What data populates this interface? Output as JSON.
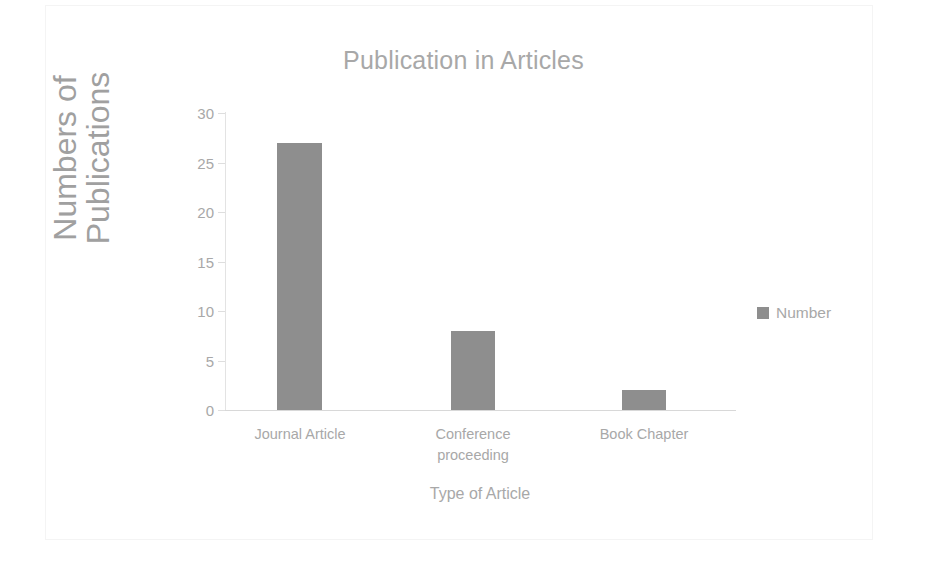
{
  "chart_data": {
    "type": "bar",
    "title": "Publication in Articles",
    "xlabel": "Type of Article",
    "ylabel": "Numbers of Publications",
    "ylabel_lines": [
      "Numbers of",
      "Publications"
    ],
    "categories": [
      "Journal Article",
      "Conference proceeding",
      "Book Chapter"
    ],
    "category_lines": [
      [
        "Journal Article"
      ],
      [
        "Conference",
        "proceeding"
      ],
      [
        "Book Chapter"
      ]
    ],
    "values": [
      27,
      8,
      2
    ],
    "series": [
      {
        "name": "Number",
        "values": [
          27,
          8,
          2
        ]
      }
    ],
    "ylim": [
      0,
      30
    ],
    "yticks": [
      30,
      25,
      20,
      15,
      10,
      5,
      0
    ],
    "ytick_labels": [
      "30",
      "25",
      "20",
      "15",
      "10",
      "5",
      "0"
    ],
    "grid": false,
    "legend": {
      "position": "right",
      "entries": [
        {
          "label": "Number",
          "color": "#8e8e8e",
          "marker": "square-marker"
        }
      ]
    },
    "colors": {
      "bar": "#8e8e8e",
      "text": "#a8a8a8",
      "axis": "#dedede",
      "frame": "#f4f4f4",
      "background": "#ffffff"
    }
  }
}
